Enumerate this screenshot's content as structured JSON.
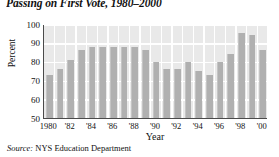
{
  "chart_data": {
    "type": "bar",
    "title": "Passing on First Vote, 1980–2000",
    "xlabel": "Year",
    "ylabel": "Percent",
    "ylim": [
      50,
      100
    ],
    "yticks": [
      50,
      60,
      70,
      80,
      90,
      100
    ],
    "grid": true,
    "legend": null,
    "source": "NYS Education Department",
    "source_prefix": "Source:",
    "categories": [
      "1980",
      "1981",
      "1982",
      "1983",
      "1984",
      "1985",
      "1986",
      "1987",
      "1988",
      "1989",
      "1990",
      "1991",
      "1992",
      "1993",
      "1994",
      "1995",
      "1996",
      "1997",
      "1998",
      "1999",
      "2000"
    ],
    "tick_labels": [
      "1980",
      "",
      "'82",
      "",
      "'84",
      "",
      "'86",
      "",
      "'88",
      "",
      "'90",
      "",
      "'92",
      "",
      "'94",
      "",
      "'96",
      "",
      "'98",
      "",
      "'00"
    ],
    "values": [
      73,
      76,
      81,
      86,
      88,
      88,
      88,
      88,
      88,
      86,
      80,
      76,
      76,
      80,
      75,
      73,
      80,
      84,
      95,
      94,
      86
    ]
  }
}
